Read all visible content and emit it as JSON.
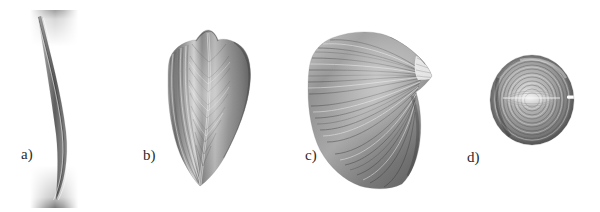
{
  "figure": {
    "background_color": "#ffffff",
    "width": 600,
    "height": 212,
    "ink_color": "#2b2b2b",
    "caption": ""
  },
  "panels": [
    {
      "key": "a",
      "label": "a)",
      "architecture": "strap",
      "description": "long slender curved parallel-fibred strap muscle",
      "fiber_orientation": "parallel, longitudinal",
      "bounds": {
        "x": 30,
        "y": 14,
        "width": 45,
        "height": 188
      },
      "label_position": {
        "x": 21,
        "y": 147
      }
    },
    {
      "key": "b",
      "label": "b)",
      "architecture": "fusiform-bipennate",
      "description": "broad muscle belly tapering to a distal point with central tendon and pennate fibres",
      "fiber_orientation": "pennate about a central tendon",
      "bounds": {
        "x": 140,
        "y": 28,
        "width": 110,
        "height": 158
      },
      "label_position": {
        "x": 143,
        "y": 148
      }
    },
    {
      "key": "c",
      "label": "c)",
      "architecture": "convergent-fan",
      "description": "fan shaped convergent muscle radiating from a narrow tendon at the upper right to a broad origin at the left",
      "fiber_orientation": "convergent, radiating",
      "bounds": {
        "x": 305,
        "y": 30,
        "width": 140,
        "height": 160
      },
      "label_position": {
        "x": 305,
        "y": 148
      }
    },
    {
      "key": "d",
      "label": "d)",
      "architecture": "circular-sphincter",
      "description": "circular sphincter muscle of concentric fibre rings with a small aperture at the right margin",
      "fiber_orientation": "concentric rings",
      "bounds": {
        "x": 492,
        "y": 55,
        "width": 85,
        "height": 90
      },
      "label_position": {
        "x": 467,
        "y": 150
      }
    }
  ]
}
